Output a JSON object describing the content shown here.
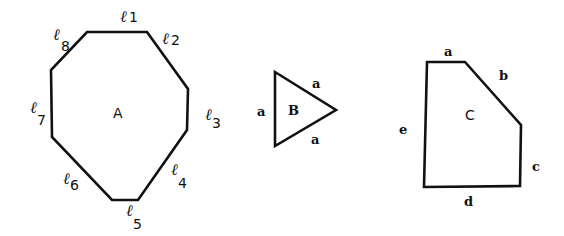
{
  "figure": {
    "shapes": [
      {
        "name": "A",
        "type": "octagon",
        "label": "A",
        "edges": [
          {
            "id": "l1",
            "symbol": "ℓ",
            "sub": "1"
          },
          {
            "id": "l2",
            "symbol": "ℓ",
            "sub": "2"
          },
          {
            "id": "l3",
            "symbol": "ℓ",
            "sub": "3"
          },
          {
            "id": "l4",
            "symbol": "ℓ",
            "sub": "4"
          },
          {
            "id": "l5",
            "symbol": "ℓ",
            "sub": "5"
          },
          {
            "id": "l6",
            "symbol": "ℓ",
            "sub": "6"
          },
          {
            "id": "l7",
            "symbol": "ℓ",
            "sub": "7"
          },
          {
            "id": "l8",
            "symbol": "ℓ",
            "sub": "8"
          }
        ]
      },
      {
        "name": "B",
        "type": "equilateral-triangle",
        "label": "B",
        "edges": [
          {
            "id": "left",
            "label": "a"
          },
          {
            "id": "upper",
            "label": "a"
          },
          {
            "id": "lower",
            "label": "a"
          }
        ]
      },
      {
        "name": "C",
        "type": "pentagon",
        "label": "C",
        "edges": [
          {
            "id": "top",
            "label": "a"
          },
          {
            "id": "diagonal",
            "label": "b"
          },
          {
            "id": "right",
            "label": "c"
          },
          {
            "id": "bottom",
            "label": "d"
          },
          {
            "id": "left",
            "label": "e"
          }
        ]
      }
    ]
  }
}
